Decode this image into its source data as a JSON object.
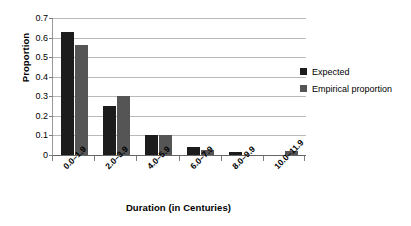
{
  "chart_data": {
    "type": "bar",
    "title": "",
    "xlabel": "Duration (in Centuries)",
    "ylabel": "Proportion",
    "categories": [
      "0.0–1.9",
      "2.0–3.9",
      "4.0–5.9",
      "6.0–7.9",
      "8.0–9.9",
      "10.0–11.9"
    ],
    "series": [
      {
        "name": "Expected",
        "color": "#1c1c1c",
        "values": [
          0.63,
          0.25,
          0.1,
          0.04,
          0.015,
          0.002
        ]
      },
      {
        "name": "Empirical proportion",
        "color": "#555555",
        "values": [
          0.56,
          0.3,
          0.1,
          0.025,
          0.0,
          0.02
        ]
      }
    ],
    "ylim": [
      0,
      0.7
    ],
    "ytick_labels": [
      "0.7",
      "0.6",
      "0.5",
      "0.4",
      "0.3",
      "0.2",
      "0.1",
      "0"
    ],
    "ytick_values": [
      0.7,
      0.6,
      0.5,
      0.4,
      0.3,
      0.2,
      0.1,
      0
    ],
    "grid": true,
    "legend_position": "right"
  },
  "legend": {
    "items": [
      {
        "label": "Expected",
        "color": "#1c1c1c"
      },
      {
        "label": "Empirical proportion",
        "color": "#555555"
      }
    ]
  },
  "colors": {
    "expected": "#1c1c1c",
    "empirical": "#555555",
    "gridline": "#b9b9b9",
    "axis": "#666666",
    "background": "#ffffff",
    "text": "#000000"
  }
}
